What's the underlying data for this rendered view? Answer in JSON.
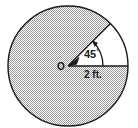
{
  "figure": {
    "type": "circle-sector-diagram",
    "center_label": "O",
    "angle_label": "45",
    "angle_degree_symbol": "°",
    "radius_label": "2 ft.",
    "colors": {
      "background": "#ffffff",
      "stroke": "#1a1a1a",
      "shaded_fill": "#c9c9c9",
      "unshaded_fill": "#ffffff",
      "text": "#1a1a1a"
    },
    "geometry": {
      "center_x": 68,
      "center_y": 66,
      "radius_px": 60,
      "sector_angle_deg": 45,
      "shaded_region_deg": 315
    }
  }
}
